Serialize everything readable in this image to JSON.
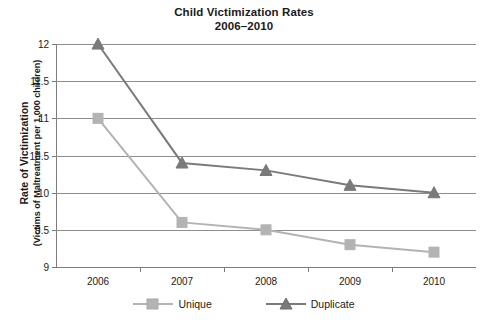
{
  "chart_data": {
    "type": "line",
    "title": "Child Victimization Rates",
    "subtitle": "2006–2010",
    "xlabel": "",
    "ylabel": "Rate of Victimization",
    "ylabel_sub": "(Victims of Maltreatment per 1,000 children)",
    "categories": [
      "2006",
      "2007",
      "2008",
      "2009",
      "2010"
    ],
    "x": [
      2006,
      2007,
      2008,
      2009,
      2010
    ],
    "ylim": [
      9,
      12
    ],
    "ytick_labels": [
      "12",
      "11.5",
      "11",
      "10.5",
      "10",
      "9.5",
      "9"
    ],
    "ytick_values": [
      12,
      11.5,
      11,
      10.5,
      10,
      9.5,
      9
    ],
    "grid": true,
    "legend_position": "bottom",
    "series": [
      {
        "name": "Unique",
        "color": "#b3b3b3",
        "marker": "square",
        "values": [
          11.0,
          9.6,
          9.5,
          9.3,
          9.2
        ]
      },
      {
        "name": "Duplicate",
        "color": "#7a7a7a",
        "marker": "triangle",
        "values": [
          12.0,
          10.4,
          10.3,
          10.1,
          10.0
        ]
      }
    ]
  },
  "legend": {
    "entries": [
      {
        "label": "Unique"
      },
      {
        "label": "Duplicate"
      }
    ]
  },
  "colors": {
    "unique": "#b3b3b3",
    "duplicate": "#7a7a7a",
    "axis": "#7c7c7c",
    "grid": "#8e8e8e",
    "text": "#1a1a1a"
  }
}
